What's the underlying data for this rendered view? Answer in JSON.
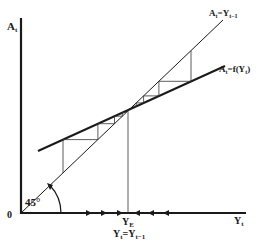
{
  "diagram": {
    "type": "cobweb-equilibrium",
    "labels": {
      "y_axis": "A",
      "y_axis_sub": "t",
      "x_axis": "Y",
      "x_axis_sub": "t",
      "origin": "0",
      "angle": "45°",
      "line_45": {
        "main": "A",
        "sub1": "t",
        "eq": "=Y",
        "sub2": "t−1"
      },
      "line_f": {
        "main": "A",
        "sub1": "t",
        "eq": "=f(Y",
        "sub2": "t",
        "close": ")"
      },
      "equilibrium": {
        "main": "Y",
        "sub": "E"
      },
      "equilibrium_cond": {
        "a": "Y",
        "a_sub": "t",
        "eq": "=Y",
        "b_sub": "t−1"
      }
    },
    "arrows": {
      "right_pointing_x": [
        89,
        104,
        120
      ],
      "left_pointing_x": [
        137,
        151,
        166
      ]
    },
    "colors": {
      "ink": "#1a1a1a",
      "thin": "#333333",
      "background": "#ffffff"
    }
  }
}
